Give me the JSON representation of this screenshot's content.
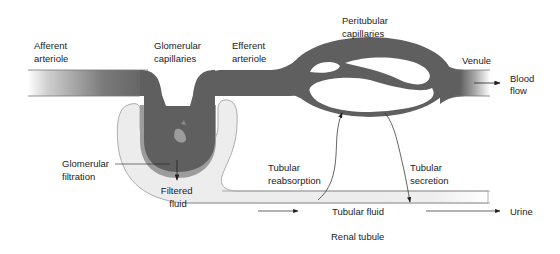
{
  "diagram": {
    "colors": {
      "vessel": "#5f5f5f",
      "vessel_light": "#8a8a8a",
      "tubule": "#ececec",
      "tubule_edge": "#9a9a9a",
      "capsule_inner": "#9c9c9c",
      "arrow": "#222222",
      "text": "#222222"
    },
    "labels": {
      "afferent_arteriole": [
        "Afferent",
        "arteriole"
      ],
      "glomerular_capillaries": [
        "Glomerular",
        "capillaries"
      ],
      "efferent_arteriole": [
        "Efferent",
        "arteriole"
      ],
      "peritubular_capillaries": [
        "Peritubular",
        "capillaries"
      ],
      "venule": "Venule",
      "blood_flow": [
        "Blood",
        "flow"
      ],
      "glomerular_filtration": [
        "Glomerular",
        "filtration"
      ],
      "filtered_fluid": [
        "Filtered",
        "fluid"
      ],
      "tubular_reabsorption": [
        "Tubular",
        "reabsorption"
      ],
      "tubular_secretion": [
        "Tubular",
        "secretion"
      ],
      "tubular_fluid": "Tubular fluid",
      "urine": "Urine",
      "renal_tubule": "Renal tubule"
    }
  }
}
